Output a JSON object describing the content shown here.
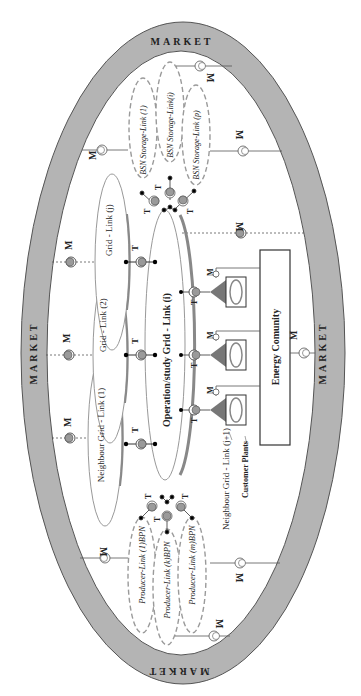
{
  "diagram": {
    "market": {
      "label": "MARKET",
      "ring_color": "#b4b4b4",
      "labels": [
        {
          "id": "top",
          "text": "MARKET"
        },
        {
          "id": "left",
          "text": "MARKET"
        },
        {
          "id": "right",
          "text": "MARKET"
        },
        {
          "id": "bottom",
          "text": "MARKET"
        }
      ]
    },
    "main_grid": {
      "label": "Operation/study Grid - Link (i)"
    },
    "neighbour_grids": [
      {
        "label": "Grid - Link (j)"
      },
      {
        "label": "Grid - Link (2)"
      },
      {
        "label": "Neighbour Grid - Link (1)"
      }
    ],
    "storage_links": [
      {
        "label": "BSN Storage-Link (1)"
      },
      {
        "label": "BSN Storage-Link(i)"
      },
      {
        "label": "BSN Storage-Link (p)"
      }
    ],
    "producer_links": [
      {
        "label": "Producer-Link (1)BPN"
      },
      {
        "label": "Producer-Link (k)BPN"
      },
      {
        "label": "Producer-Link (m)BPN"
      }
    ],
    "energy_community": {
      "label": "Energy Comunity"
    },
    "customer_plants": {
      "label": "Customer Plants"
    },
    "neighbour_next": {
      "label": "Neighbour Grid - Link (j+1)"
    },
    "symbols": {
      "meter": "M",
      "transformer": "T"
    },
    "colors": {
      "ring": "#b4b4b4",
      "node_fill": "#9a9a9a",
      "dashed_ellipse": "#9a9a9a",
      "line": "#444444",
      "plant_triangle": "#777777"
    }
  }
}
